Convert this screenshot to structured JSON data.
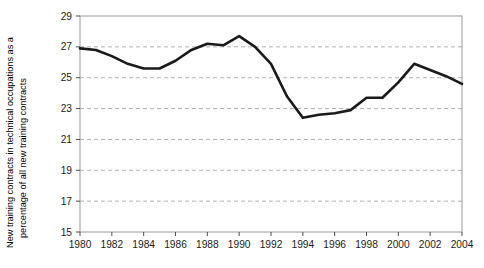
{
  "chart_data": {
    "type": "line",
    "title": "",
    "subtitle": "",
    "xlabel": "",
    "ylabel": "New training contracts in technical occupations as a percentage of all new training contracts",
    "ylabel_lines": [
      "New training contracts in technical occupations as a",
      "percentage of all new training contracts"
    ],
    "xlim": [
      1980,
      2004
    ],
    "ylim": [
      15,
      29
    ],
    "ytick_step": 2,
    "xtick_step": 2,
    "grid": true,
    "grid_style": "dashed-horizontal",
    "legend": "none",
    "x_tick_labels": [
      "1980",
      "1982",
      "1984",
      "1986",
      "1988",
      "1990",
      "1992",
      "1994",
      "1996",
      "1998",
      "2000",
      "2002",
      "2004"
    ],
    "y_tick_labels": [
      "15",
      "17",
      "19",
      "21",
      "23",
      "25",
      "27",
      "29"
    ],
    "y_tick_values": [
      15,
      17,
      19,
      21,
      23,
      25,
      27,
      29
    ],
    "x": [
      1980,
      1981,
      1982,
      1983,
      1984,
      1985,
      1986,
      1987,
      1988,
      1989,
      1990,
      1991,
      1992,
      1993,
      1994,
      1995,
      1996,
      1997,
      1998,
      1999,
      2000,
      2001,
      2002,
      2003,
      2004
    ],
    "values": [
      26.9,
      26.8,
      26.4,
      25.9,
      25.6,
      25.6,
      26.1,
      26.8,
      27.2,
      27.1,
      27.7,
      27.0,
      25.9,
      23.8,
      22.4,
      22.6,
      22.7,
      22.9,
      23.7,
      23.7,
      24.7,
      25.9,
      25.5,
      25.1,
      24.6
    ],
    "series": [
      {
        "name": "New training contracts in technical occupations (%)",
        "color": "#1a1a1a",
        "line_width": 2.6,
        "values": [
          26.9,
          26.8,
          26.4,
          25.9,
          25.6,
          25.6,
          26.1,
          26.8,
          27.2,
          27.1,
          27.7,
          27.0,
          25.9,
          23.8,
          22.4,
          22.6,
          22.7,
          22.9,
          23.7,
          23.7,
          24.7,
          25.9,
          25.5,
          25.1,
          24.6
        ]
      }
    ],
    "colors": {
      "line": "#1a1a1a",
      "grid": "#b0b0b0",
      "frame": "#9a9a9a",
      "axis": "#4d4d4d",
      "background": "#ffffff"
    }
  }
}
